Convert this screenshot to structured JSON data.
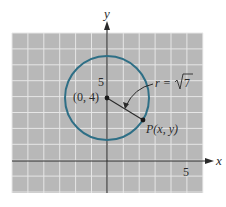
{
  "figure": {
    "axes": {
      "x_label": "x",
      "y_label": "y",
      "x_tick_label": "5",
      "y_tick_label": "5",
      "x_range": [
        -6,
        6
      ],
      "y_range": [
        -2,
        8
      ]
    },
    "circle": {
      "center": [
        0,
        4
      ],
      "radius_expr": "r = √7",
      "radius_value": 2.6458,
      "stroke_color": "#2e6f86"
    },
    "labels": {
      "center": "(0, 4)",
      "point": "P(x, y)",
      "radius_prefix": "r = ",
      "radius_radicand": "7"
    },
    "colors": {
      "grid_background": "#b8b8b8",
      "grid_lines": "#e6e6e6",
      "axis": "#2a2a2a"
    }
  }
}
